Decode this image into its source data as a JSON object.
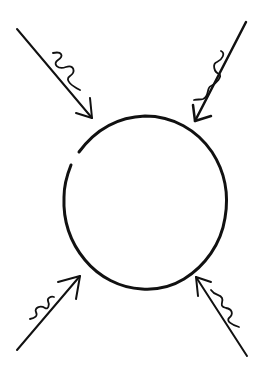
{
  "diagram": {
    "colors": {
      "background": "#ffffff",
      "ink": "#111111"
    },
    "circle": {
      "cx": 145,
      "cy": 203,
      "rx": 81,
      "ry": 87,
      "stroke_width": 3,
      "gap_note": "small break in outline at upper-left"
    },
    "arrows": [
      {
        "id": "top-left",
        "from": [
          17,
          29
        ],
        "to": [
          92,
          118
        ],
        "stroke_width": 2,
        "head_left": [
          76,
          113
        ],
        "head_right": [
          90,
          98
        ],
        "squiggle": "M 53 53 C 62 51, 64 56, 58 60 C 52 64, 58 70, 66 67 C 74 64, 76 72, 70 76 C 64 80, 72 86, 80 90"
      },
      {
        "id": "top-right",
        "from": [
          246,
          22
        ],
        "to": [
          195,
          121
        ],
        "stroke_width": 2.5,
        "head_left": [
          193,
          105
        ],
        "head_right": [
          211,
          116
        ],
        "squiggle": "M 221 51 C 226 53, 222 60, 217 62 C 212 64, 214 72, 219 74 C 223 76, 216 84, 211 86 C 206 88, 210 96, 203 99 C 200 100, 197 99, 194 100"
      },
      {
        "id": "bottom-left",
        "from": [
          17,
          350
        ],
        "to": [
          80,
          276
        ],
        "stroke_width": 2,
        "head_left": [
          58,
          282
        ],
        "head_right": [
          76,
          299
        ],
        "squiggle": "M 30 319 C 35 318, 38 316, 36 312 C 34 308, 40 305, 45 308 C 48 310, 50 305, 48 301 C 47 298, 51 296, 54 297"
      },
      {
        "id": "bottom-right",
        "from": [
          247,
          356
        ],
        "to": [
          196,
          277
        ],
        "stroke_width": 2,
        "head_left": [
          198,
          296
        ],
        "head_right": [
          211,
          282
        ],
        "squiggle": "M 211 290 C 215 296, 220 294, 222 298 C 224 302, 218 306, 226 308 C 232 309, 234 314, 229 318 C 226 321, 232 325, 239 327"
      }
    ]
  }
}
